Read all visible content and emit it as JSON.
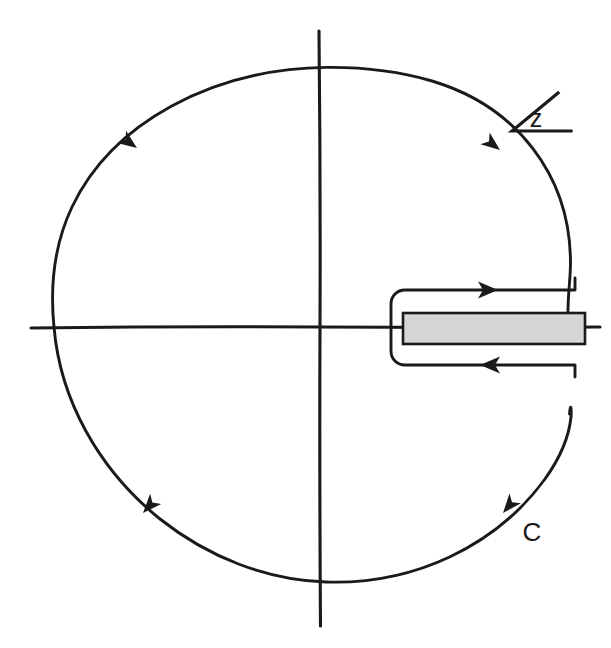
{
  "figure": {
    "background_color": "#ffffff",
    "ink_color": "#1a1a1a",
    "width": 611,
    "height": 648
  },
  "labels": {
    "variable_label": "z",
    "contour_label": "C"
  },
  "geometry": {
    "origin": {
      "x": 320,
      "y": 327
    },
    "circle_radius": 257,
    "horizontal_axis": {
      "x1": 31,
      "x2": 600,
      "y": 327
    },
    "vertical_axis": {
      "x": 320,
      "y1": 31,
      "y2": 626
    },
    "keyhole": {
      "tip_x": 391,
      "upper_y": 290,
      "lower_y": 365,
      "right_x": 575,
      "corner_radius": 12
    },
    "branch_cut": {
      "x_start": 403,
      "x_end": 585,
      "y_top": 313,
      "y_bottom": 344,
      "fill_color": "#d6d6d6",
      "stroke_color": "#1a1a1a"
    }
  },
  "arrows": [
    {
      "name": "upper-left-arrow",
      "x": 137,
      "y": 148,
      "angle": 218,
      "direction": "counterclockwise"
    },
    {
      "name": "lower-left-arrow",
      "x": 143,
      "y": 513,
      "angle": 310,
      "direction": "counterclockwise"
    },
    {
      "name": "upper-right-arrow",
      "x": 500,
      "y": 150,
      "angle": 219,
      "direction": "counterclockwise"
    },
    {
      "name": "lower-right-arrow",
      "x": 503,
      "y": 513,
      "angle": 312,
      "direction": "counterclockwise"
    },
    {
      "name": "branch-cut-top-arrow",
      "x": 487,
      "y": 290,
      "angle": 0,
      "direction": "rightward"
    },
    {
      "name": "branch-cut-bottom-arrow",
      "x": 490,
      "y": 365,
      "angle": 180,
      "direction": "leftward"
    }
  ],
  "angle_symbol": {
    "name": "angle-z-symbol",
    "apex": {
      "x": 512,
      "y": 131
    },
    "ray_tip": {
      "x": 558,
      "y": 93
    },
    "base_tip": {
      "x": 571,
      "y": 131
    },
    "text_x": 536,
    "text_y": 126,
    "font_size": 25
  },
  "contour_label_position": {
    "x": 532,
    "y": 541,
    "font_size": 25
  }
}
